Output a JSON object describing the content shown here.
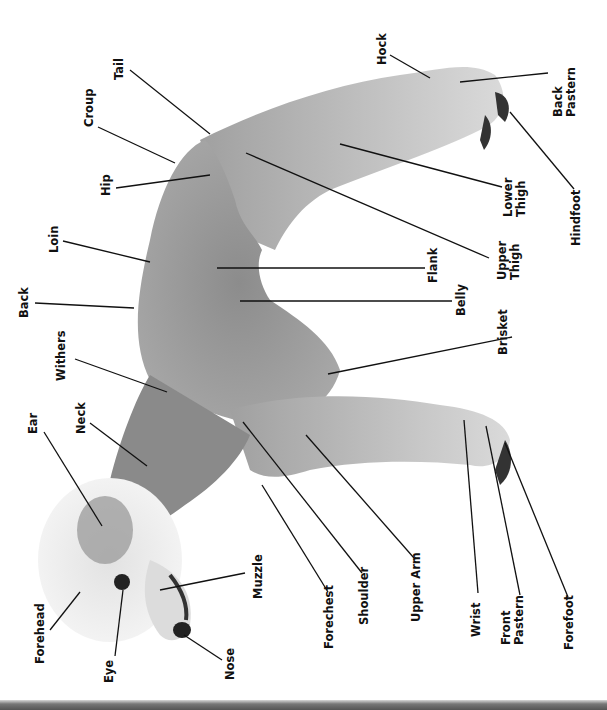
{
  "diagram": {
    "orientation": "rotated 90 degrees counter-clockwise",
    "colors": {
      "background": "#ffffff",
      "body_fur": "#9a9a9a",
      "body_fur_dark": "#7a7a7a",
      "head_fur": "#e6e6e6",
      "legs_fur": "#c8c8c8",
      "leader_line": "#111111",
      "label_text": "#111111"
    },
    "labels": [
      {
        "id": "tail",
        "text": "Tail",
        "x": 113,
        "y": 80,
        "line": [
          130,
          70,
          210,
          134
        ]
      },
      {
        "id": "croup",
        "text": "Croup",
        "x": 83,
        "y": 127,
        "line": [
          98,
          127,
          175,
          163
        ]
      },
      {
        "id": "hip",
        "text": "Hip",
        "x": 100,
        "y": 196,
        "line": [
          116,
          188,
          210,
          175
        ]
      },
      {
        "id": "loin",
        "text": "Loin",
        "x": 48,
        "y": 253,
        "line": [
          63,
          241,
          150,
          262
        ]
      },
      {
        "id": "back",
        "text": "Back",
        "x": 18,
        "y": 318,
        "line": [
          35,
          303,
          134,
          308
        ]
      },
      {
        "id": "withers",
        "text": "Withers",
        "x": 55,
        "y": 381,
        "line": [
          75,
          359,
          167,
          392
        ]
      },
      {
        "id": "neck",
        "text": "Neck",
        "x": 75,
        "y": 434,
        "line": [
          90,
          423,
          147,
          466
        ]
      },
      {
        "id": "ear",
        "text": "Ear",
        "x": 27,
        "y": 434,
        "line": [
          44,
          432,
          102,
          526
        ]
      },
      {
        "id": "forehead",
        "text": "Forehead",
        "x": 34,
        "y": 664,
        "line": [
          50,
          630,
          80,
          592
        ]
      },
      {
        "id": "eye",
        "text": "Eye",
        "x": 103,
        "y": 683,
        "line": [
          115,
          656,
          123,
          590
        ]
      },
      {
        "id": "nose",
        "text": "Nose",
        "x": 224,
        "y": 680,
        "line": [
          222,
          660,
          184,
          635
        ]
      },
      {
        "id": "muzzle",
        "text": "Muzzle",
        "x": 252,
        "y": 599,
        "line": [
          245,
          573,
          160,
          590
        ]
      },
      {
        "id": "forechest",
        "text": "Forechest",
        "x": 323,
        "y": 649,
        "line": [
          328,
          592,
          262,
          485
        ]
      },
      {
        "id": "shoulder",
        "text": "Shoulder",
        "x": 358,
        "y": 625,
        "line": [
          362,
          573,
          243,
          422
        ]
      },
      {
        "id": "upper-arm",
        "text": "Upper Arm",
        "x": 410,
        "y": 622,
        "line": [
          414,
          558,
          306,
          435
        ]
      },
      {
        "id": "wrist",
        "text": "Wrist",
        "x": 470,
        "y": 637,
        "line": [
          478,
          593,
          464,
          420
        ]
      },
      {
        "id": "front-pastern",
        "text": "Front\nPastern",
        "x": 500,
        "y": 645,
        "line": [
          520,
          595,
          486,
          426
        ]
      },
      {
        "id": "forefoot",
        "text": "Forefoot",
        "x": 563,
        "y": 650,
        "line": [
          568,
          597,
          505,
          443
        ]
      },
      {
        "id": "brisket",
        "text": "Brisket",
        "x": 497,
        "y": 355,
        "line": [
          512,
          337,
          328,
          374
        ]
      },
      {
        "id": "belly",
        "text": "Belly",
        "x": 455,
        "y": 316,
        "line": [
          452,
          301,
          240,
          301
        ]
      },
      {
        "id": "flank",
        "text": "Flank",
        "x": 427,
        "y": 283,
        "line": [
          425,
          268,
          217,
          268
        ]
      },
      {
        "id": "upper-thigh",
        "text": "Upper\nThigh",
        "x": 496,
        "y": 280,
        "line": [
          489,
          258,
          246,
          153
        ]
      },
      {
        "id": "lower-thigh",
        "text": "Lower\nThigh",
        "x": 502,
        "y": 217,
        "line": [
          502,
          187,
          340,
          144
        ]
      },
      {
        "id": "hindfoot",
        "text": "Hindfoot",
        "x": 570,
        "y": 246,
        "line": [
          574,
          189,
          510,
          112
        ]
      },
      {
        "id": "back-pastern",
        "text": "Back\nPastern",
        "x": 552,
        "y": 117,
        "line": [
          548,
          73,
          460,
          82
        ]
      },
      {
        "id": "hock",
        "text": "Hock",
        "x": 376,
        "y": 65,
        "line": [
          390,
          55,
          430,
          78
        ]
      }
    ]
  }
}
